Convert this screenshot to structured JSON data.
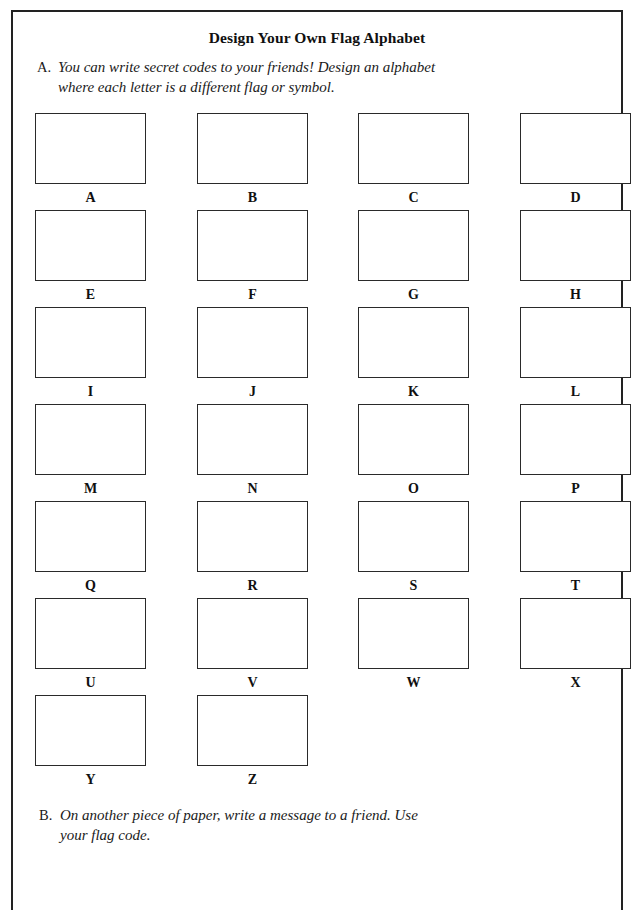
{
  "page": {
    "title": "Design Your Own Flag Alphabet"
  },
  "instructions": {
    "a": {
      "marker": "A.",
      "line1": "You can write secret codes to your friends! Design an alphabet",
      "line2": "where each letter is a different flag or symbol."
    },
    "b": {
      "marker": "B.",
      "line1": "On another piece of paper, write a message to a friend. Use",
      "line2": "your flag code."
    }
  },
  "alphabet_grid": {
    "rows": [
      {
        "cells": [
          {
            "letter": "A"
          },
          {
            "letter": "B"
          },
          {
            "letter": "C"
          },
          {
            "letter": "D"
          }
        ]
      },
      {
        "cells": [
          {
            "letter": "E"
          },
          {
            "letter": "F"
          },
          {
            "letter": "G"
          },
          {
            "letter": "H"
          }
        ]
      },
      {
        "cells": [
          {
            "letter": "I"
          },
          {
            "letter": "J"
          },
          {
            "letter": "K"
          },
          {
            "letter": "L"
          }
        ]
      },
      {
        "cells": [
          {
            "letter": "M"
          },
          {
            "letter": "N"
          },
          {
            "letter": "O"
          },
          {
            "letter": "P"
          }
        ]
      },
      {
        "cells": [
          {
            "letter": "Q"
          },
          {
            "letter": "R"
          },
          {
            "letter": "S"
          },
          {
            "letter": "T"
          }
        ]
      },
      {
        "cells": [
          {
            "letter": "U"
          },
          {
            "letter": "V"
          },
          {
            "letter": "W"
          },
          {
            "letter": "X"
          }
        ]
      },
      {
        "cells": [
          {
            "letter": "Y"
          },
          {
            "letter": "Z"
          }
        ]
      }
    ]
  },
  "colors": {
    "ink": "#101010",
    "border": "#2a2a2a",
    "page_border": "#222222",
    "paper": "#ffffff"
  }
}
